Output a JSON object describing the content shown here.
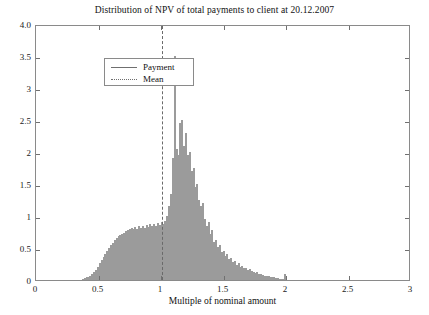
{
  "chart_data": {
    "type": "bar",
    "title": "Distribution of NPV of total payments to client at 20.12.2007",
    "xlabel": "Multiple of nominal amount",
    "ylabel": "",
    "xlim": [
      0,
      3
    ],
    "ylim": [
      0,
      4.0
    ],
    "grid": false,
    "legend_position": "upper-left",
    "xticks": [
      "0",
      "0.5",
      "1",
      "1.5",
      "2",
      "2.5",
      "3"
    ],
    "xtick_values": [
      0,
      0.5,
      1,
      1.5,
      2,
      2.5,
      3
    ],
    "yticks": [
      "0",
      "0.5",
      "1",
      "1.5",
      "2",
      "2.5",
      "3",
      "3.5",
      "4.0"
    ],
    "ytick_values": [
      0,
      0.5,
      1,
      1.5,
      2,
      2.5,
      3,
      3.5,
      4.0
    ],
    "series": [
      {
        "name": "Payment",
        "style": "histogram",
        "bin_width": 0.015,
        "x": [
          0.375,
          0.39,
          0.405,
          0.42,
          0.435,
          0.45,
          0.465,
          0.48,
          0.495,
          0.51,
          0.525,
          0.54,
          0.555,
          0.57,
          0.585,
          0.6,
          0.615,
          0.63,
          0.645,
          0.66,
          0.675,
          0.69,
          0.705,
          0.72,
          0.735,
          0.75,
          0.765,
          0.78,
          0.795,
          0.81,
          0.825,
          0.84,
          0.855,
          0.87,
          0.885,
          0.9,
          0.915,
          0.93,
          0.945,
          0.96,
          0.975,
          0.99,
          1.005,
          1.02,
          1.035,
          1.05,
          1.065,
          1.08,
          1.095,
          1.11,
          1.125,
          1.14,
          1.155,
          1.17,
          1.185,
          1.2,
          1.215,
          1.23,
          1.245,
          1.26,
          1.275,
          1.29,
          1.305,
          1.32,
          1.335,
          1.35,
          1.365,
          1.38,
          1.395,
          1.41,
          1.425,
          1.44,
          1.455,
          1.47,
          1.485,
          1.5,
          1.515,
          1.53,
          1.545,
          1.56,
          1.575,
          1.59,
          1.605,
          1.62,
          1.635,
          1.65,
          1.665,
          1.68,
          1.695,
          1.71,
          1.725,
          1.74,
          1.755,
          1.77,
          1.785,
          1.8,
          1.815,
          1.83,
          1.845,
          1.86,
          1.875,
          1.89,
          1.905,
          1.92,
          1.935,
          1.95,
          1.965,
          1.98,
          1.995
        ],
        "values": [
          0.02,
          0.03,
          0.04,
          0.05,
          0.07,
          0.09,
          0.12,
          0.16,
          0.21,
          0.26,
          0.31,
          0.36,
          0.41,
          0.46,
          0.5,
          0.54,
          0.58,
          0.62,
          0.65,
          0.68,
          0.7,
          0.72,
          0.74,
          0.76,
          0.78,
          0.8,
          0.82,
          0.79,
          0.83,
          0.8,
          0.84,
          0.81,
          0.85,
          0.82,
          0.86,
          0.83,
          0.87,
          0.84,
          0.88,
          0.85,
          0.89,
          0.86,
          0.9,
          0.87,
          0.92,
          1.0,
          1.15,
          1.35,
          1.9,
          3.5,
          2.05,
          1.95,
          2.45,
          2.5,
          2.1,
          2.3,
          1.95,
          2.0,
          1.7,
          1.75,
          1.45,
          1.5,
          1.25,
          1.15,
          1.2,
          0.95,
          0.85,
          0.9,
          0.72,
          0.78,
          0.6,
          0.62,
          0.52,
          0.55,
          0.44,
          0.46,
          0.38,
          0.4,
          0.33,
          0.35,
          0.28,
          0.3,
          0.24,
          0.26,
          0.21,
          0.22,
          0.18,
          0.19,
          0.16,
          0.17,
          0.14,
          0.13,
          0.11,
          0.12,
          0.1,
          0.09,
          0.08,
          0.07,
          0.06,
          0.06,
          0.05,
          0.04,
          0.04,
          0.03,
          0.03,
          0.02,
          0.02,
          0.01,
          0.09
        ]
      },
      {
        "name": "Mean",
        "style": "vertical-dashed-line",
        "x": 1.01
      }
    ]
  },
  "legend": {
    "entries": [
      {
        "label": "Payment",
        "style": "solid"
      },
      {
        "label": "Mean",
        "style": "dotted"
      }
    ]
  }
}
